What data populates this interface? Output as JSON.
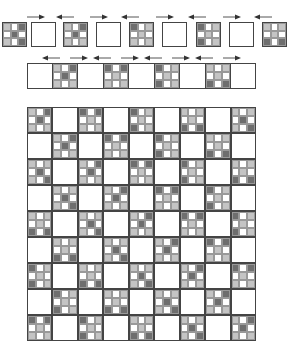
{
  "diagram": {
    "title": "",
    "colors": {
      "white": "#ffffff",
      "light": "#c4c4c4",
      "dark": "#6e6e6e",
      "border": "#444444"
    },
    "top_row": {
      "y": 22,
      "size": 25,
      "x_positions": [
        2,
        31,
        63,
        96,
        129,
        162,
        196,
        229,
        262
      ],
      "blocks": [
        {
          "type": "ninepatch",
          "cells": [
            1,
            0,
            2,
            0,
            2,
            0,
            1,
            0,
            2
          ]
        },
        {
          "type": "plain"
        },
        {
          "type": "ninepatch",
          "cells": [
            1,
            0,
            2,
            0,
            2,
            0,
            1,
            0,
            1
          ]
        },
        {
          "type": "plain"
        },
        {
          "type": "ninepatch",
          "cells": [
            2,
            0,
            1,
            0,
            1,
            0,
            1,
            0,
            1
          ]
        },
        {
          "type": "plain"
        },
        {
          "type": "ninepatch",
          "cells": [
            2,
            0,
            1,
            0,
            1,
            0,
            2,
            0,
            1
          ]
        },
        {
          "type": "plain"
        },
        {
          "type": "ninepatch",
          "cells": [
            1,
            0,
            1,
            0,
            1,
            0,
            2,
            0,
            2
          ]
        }
      ],
      "arrows": [
        "right",
        "left",
        "right",
        "left",
        "right",
        "left",
        "right",
        "left"
      ]
    },
    "strip": {
      "x": 27,
      "y": 63,
      "width": 229,
      "height": 26,
      "cols": 9,
      "blocks": [
        {
          "type": "plain"
        },
        {
          "type": "ninepatch",
          "cells": [
            1,
            0,
            2,
            0,
            2,
            0,
            1,
            0,
            1
          ]
        },
        {
          "type": "plain"
        },
        {
          "type": "ninepatch",
          "cells": [
            2,
            0,
            2,
            0,
            1,
            0,
            1,
            0,
            1
          ]
        },
        {
          "type": "plain"
        },
        {
          "type": "ninepatch",
          "cells": [
            2,
            0,
            1,
            0,
            1,
            0,
            2,
            0,
            1
          ]
        },
        {
          "type": "plain"
        },
        {
          "type": "ninepatch",
          "cells": [
            1,
            0,
            1,
            0,
            1,
            0,
            2,
            0,
            2
          ]
        },
        {
          "type": "plain"
        }
      ],
      "arrows": [
        "left",
        "right",
        "left",
        "right",
        "left",
        "right",
        "left",
        "right"
      ]
    },
    "main_grid": {
      "x": 27,
      "y": 107,
      "width": 229,
      "height": 234,
      "rows": 9,
      "cols": 9,
      "layout": "checkerboard: nine-patch blocks on even (row+col), plain white blocks on odd",
      "patterns": [
        [
          1,
          0,
          2,
          0,
          2,
          0,
          1,
          0,
          1
        ],
        [
          2,
          0,
          2,
          0,
          1,
          0,
          1,
          0,
          1
        ],
        [
          2,
          0,
          1,
          0,
          1,
          0,
          2,
          0,
          1
        ],
        [
          1,
          0,
          1,
          0,
          1,
          0,
          2,
          0,
          2
        ],
        [
          1,
          0,
          1,
          0,
          2,
          0,
          1,
          0,
          2
        ]
      ]
    }
  }
}
